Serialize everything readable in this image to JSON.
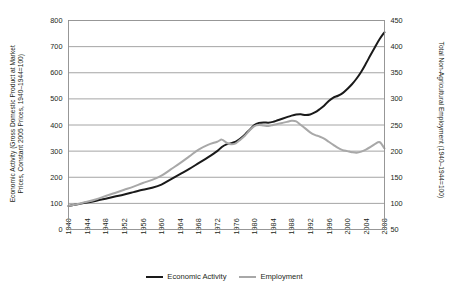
{
  "chart_data": {
    "type": "line",
    "title": "",
    "xlabel": "",
    "ylabel": "Economic Activity (Gross Domestic Product at Market Prices, Constant 2005 Prices, 1940–1944=100)",
    "y2label": "Total Non-Agricultural Employment (1940–1944=100)",
    "grid": true,
    "legend_position": "bottom-center",
    "xlim": [
      1940,
      2008
    ],
    "ylim": [
      0,
      800
    ],
    "y2lim": [
      50,
      450
    ],
    "yticks": [
      0,
      100,
      200,
      300,
      400,
      500,
      600,
      700,
      800
    ],
    "y2ticks": [
      50,
      100,
      150,
      200,
      250,
      300,
      350,
      400,
      450
    ],
    "xticks": [
      1940,
      1944,
      1948,
      1952,
      1956,
      1960,
      1964,
      1968,
      1972,
      1976,
      1980,
      1984,
      1988,
      1992,
      1996,
      2000,
      2004,
      2008
    ],
    "series": [
      {
        "name": "Economic Activity",
        "color": "#1a1a1a",
        "width": 2.0,
        "axis": "left",
        "x": [
          1940,
          1942,
          1944,
          1946,
          1948,
          1950,
          1952,
          1954,
          1956,
          1958,
          1960,
          1962,
          1964,
          1966,
          1968,
          1970,
          1972,
          1973,
          1974,
          1975,
          1976,
          1977,
          1978,
          1979,
          1980,
          1981,
          1982,
          1983,
          1984,
          1985,
          1986,
          1987,
          1988,
          1989,
          1990,
          1991,
          1992,
          1993,
          1994,
          1995,
          1996,
          1997,
          1998,
          1999,
          2000,
          2001,
          2002,
          2003,
          2004,
          2005,
          2006,
          2007,
          2008
        ],
        "values": [
          90,
          97,
          103,
          110,
          118,
          126,
          134,
          143,
          152,
          160,
          172,
          192,
          212,
          232,
          254,
          276,
          300,
          316,
          326,
          330,
          336,
          348,
          364,
          382,
          400,
          408,
          410,
          409,
          412,
          418,
          424,
          430,
          436,
          440,
          441,
          438,
          440,
          448,
          460,
          474,
          492,
          505,
          512,
          522,
          538,
          556,
          578,
          604,
          635,
          668,
          700,
          730,
          755
        ]
      },
      {
        "name": "Employment",
        "color": "#a8a8a8",
        "width": 2.0,
        "axis": "right",
        "x": [
          1940,
          1942,
          1944,
          1946,
          1948,
          1950,
          1952,
          1954,
          1956,
          1958,
          1960,
          1962,
          1964,
          1966,
          1968,
          1970,
          1972,
          1973,
          1974,
          1975,
          1976,
          1977,
          1978,
          1979,
          1980,
          1981,
          1982,
          1983,
          1984,
          1985,
          1986,
          1987,
          1988,
          1989,
          1990,
          1991,
          1992,
          1993,
          1994,
          1995,
          1996,
          1997,
          1998,
          1999,
          2000,
          2001,
          2002,
          2003,
          2004,
          2005,
          2006,
          2007,
          2008
        ],
        "values": [
          95,
          99,
          103,
          108,
          114,
          120,
          126,
          132,
          139,
          145,
          153,
          165,
          177,
          190,
          203,
          212,
          218,
          222,
          216,
          213,
          215,
          222,
          230,
          240,
          248,
          250,
          249,
          248,
          250,
          252,
          254,
          256,
          258,
          257,
          250,
          243,
          236,
          231,
          228,
          224,
          218,
          212,
          206,
          202,
          200,
          198,
          197,
          199,
          203,
          208,
          214,
          217,
          205
        ]
      }
    ]
  },
  "axes": {
    "left_title_line1": "Economic Activity (Gross Domestic Product at Market",
    "left_title_line2": "Prices, Constant 2005 Prices, 1940–1944=100)",
    "right_title": "Total Non-Agricultural Employment (1940–1944=100)"
  },
  "legend": {
    "items": [
      {
        "label": "Economic Activity",
        "color": "#1a1a1a",
        "width": "2px"
      },
      {
        "label": "Employment",
        "color": "#a8a8a8",
        "width": "2px"
      }
    ]
  },
  "caption": {
    "text": ""
  },
  "colors": {
    "economic_activity": "#1a1a1a",
    "employment": "#a8a8a8",
    "grid": "#8d8d8d",
    "text": "#231f20"
  }
}
